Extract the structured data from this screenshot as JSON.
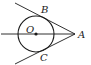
{
  "diagram": {
    "type": "geometry",
    "labels": {
      "center": "O",
      "point_a": "A",
      "point_b": "B",
      "point_c": "C"
    },
    "colors": {
      "stroke": "#1a1a1a",
      "background": "#ffffff"
    }
  }
}
